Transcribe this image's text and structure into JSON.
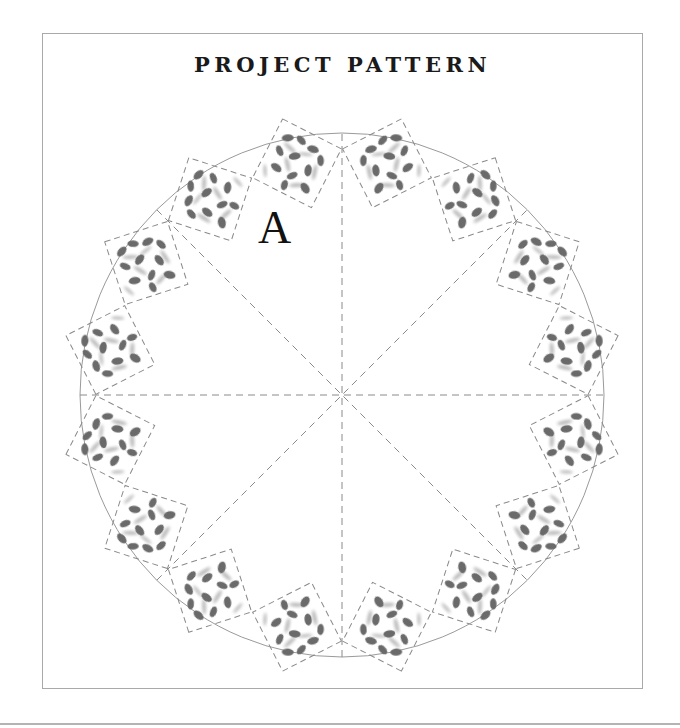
{
  "title": "PROJECT PATTERN",
  "label": "A",
  "colors": {
    "frame": "#a9a9a9",
    "circle": "#9a9a9a",
    "dash": "#8a8a8a",
    "leaf": "#6b6b6b",
    "leaf_light": "#b9b9b9",
    "text": "#111111"
  },
  "diagram": {
    "center": [
      342,
      395
    ],
    "radius": 262,
    "spoke_angles_deg": [
      0,
      45,
      90,
      135
    ],
    "tile_radius": 236,
    "tile_size": 66,
    "tile_angles_deg": [
      -11,
      11,
      34,
      56,
      79,
      101,
      124,
      146,
      169,
      191,
      214,
      236,
      259,
      281,
      304,
      326
    ],
    "label_position": [
      258,
      243
    ]
  }
}
